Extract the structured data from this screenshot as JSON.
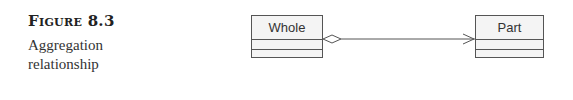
{
  "caption": {
    "label": "Figure 8.3",
    "description_line1": "Aggregation",
    "description_line2": "relationship"
  },
  "diagram": {
    "whole_class": {
      "name": "Whole"
    },
    "part_class": {
      "name": "Part"
    },
    "relationship": "aggregation",
    "line_color": "#555555"
  }
}
